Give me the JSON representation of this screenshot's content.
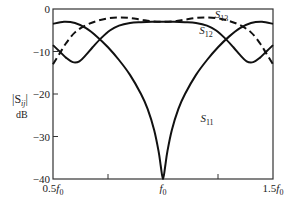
{
  "chart_data": {
    "type": "line",
    "title": "",
    "xlabel": "",
    "ylabel": "|S_ij| dB",
    "ylabel_main": "|S",
    "ylabel_sub": "ij",
    "ylabel_close": "|",
    "ylabel_unit": "dB",
    "xlim": [
      0.5,
      1.5
    ],
    "ylim": [
      -40,
      0
    ],
    "grid": false,
    "legend_position": "inline labels",
    "x_ticks": [
      {
        "value": 0.5,
        "label": "0.5",
        "italic": "f",
        "sub": "0"
      },
      {
        "value": 0.75,
        "label": ""
      },
      {
        "value": 1.0,
        "label": "",
        "italic": "f",
        "sub": "0"
      },
      {
        "value": 1.25,
        "label": ""
      },
      {
        "value": 1.5,
        "label": "1.5",
        "italic": "f",
        "sub": "0"
      }
    ],
    "y_ticks": [
      {
        "value": 0,
        "label": "0"
      },
      {
        "value": -10,
        "label": "−10"
      },
      {
        "value": -20,
        "label": "−20"
      },
      {
        "value": -30,
        "label": "−30"
      },
      {
        "value": -40,
        "label": "−40"
      }
    ],
    "series": [
      {
        "name": "S11",
        "label_main": "S",
        "label_sub": "11",
        "style": "solid",
        "label_pos": {
          "x": 1.17,
          "y": -26.5
        },
        "x": [
          0.5,
          0.55,
          0.6,
          0.65,
          0.7,
          0.75,
          0.8,
          0.85,
          0.9,
          0.93,
          0.96,
          0.98,
          0.99,
          1.0,
          1.01,
          1.02,
          1.04,
          1.07,
          1.1,
          1.15,
          1.2,
          1.25,
          1.3,
          1.35,
          1.4,
          1.45,
          1.5
        ],
        "values": [
          -3.5,
          -3.0,
          -3.3,
          -4.5,
          -6.5,
          -9.0,
          -12.0,
          -15.5,
          -20.0,
          -23.5,
          -28.5,
          -33.5,
          -37.0,
          -40.0,
          -37.0,
          -33.5,
          -28.5,
          -23.5,
          -20.0,
          -15.5,
          -12.0,
          -9.0,
          -6.5,
          -4.5,
          -3.3,
          -3.0,
          -3.5
        ]
      },
      {
        "name": "S12",
        "label_main": "S",
        "label_sub": "12",
        "style": "solid",
        "label_pos": {
          "x": 1.165,
          "y": -5.9
        },
        "x": [
          0.5,
          0.53,
          0.56,
          0.59,
          0.62,
          0.65,
          0.68,
          0.72,
          0.76,
          0.8,
          0.85,
          0.9,
          0.95,
          1.0,
          1.05,
          1.1,
          1.15,
          1.2,
          1.24,
          1.28,
          1.32,
          1.35,
          1.38,
          1.41,
          1.44,
          1.47,
          1.5
        ],
        "values": [
          -8.5,
          -10.0,
          -11.5,
          -12.5,
          -12.3,
          -10.8,
          -9.0,
          -6.8,
          -5.0,
          -3.9,
          -3.3,
          -3.1,
          -3.0,
          -3.0,
          -3.0,
          -3.1,
          -3.3,
          -3.9,
          -5.0,
          -6.8,
          -9.0,
          -10.8,
          -12.3,
          -12.5,
          -11.5,
          -10.0,
          -8.5
        ]
      },
      {
        "name": "S13",
        "label_main": "S",
        "label_sub": "13",
        "style": "dashed",
        "label_pos": {
          "x": 1.235,
          "y": -2.2
        },
        "x": [
          0.5,
          0.53,
          0.56,
          0.6,
          0.65,
          0.7,
          0.75,
          0.8,
          0.85,
          0.9,
          0.95,
          1.0,
          1.05,
          1.1,
          1.15,
          1.2,
          1.25,
          1.3,
          1.35,
          1.4,
          1.44,
          1.47,
          1.5
        ],
        "values": [
          -13.0,
          -10.5,
          -8.0,
          -5.5,
          -3.8,
          -2.8,
          -2.2,
          -2.0,
          -2.1,
          -2.5,
          -2.9,
          -3.0,
          -2.9,
          -2.5,
          -2.1,
          -2.0,
          -2.2,
          -2.8,
          -3.8,
          -5.5,
          -8.0,
          -10.5,
          -13.0
        ]
      }
    ]
  },
  "colors": {
    "line": "#111111",
    "axis": "#333333",
    "text": "#222222",
    "background": "#ffffff"
  }
}
